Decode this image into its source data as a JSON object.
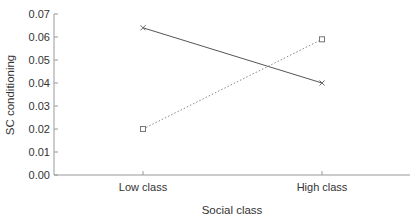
{
  "chart_data": {
    "type": "line",
    "title": "",
    "xlabel": "Social class",
    "ylabel": "SC conditioning",
    "categories": [
      "Low class",
      "High class"
    ],
    "series": [
      {
        "name": "series-cross-solid",
        "marker": "x",
        "line_style": "solid",
        "color": "#555555",
        "values": [
          0.064,
          0.04
        ]
      },
      {
        "name": "series-square-dotted",
        "marker": "square",
        "line_style": "dotted",
        "color": "#888888",
        "values": [
          0.02,
          0.059
        ]
      }
    ],
    "ylim": [
      0,
      0.07
    ],
    "yticks": [
      "0.00",
      "0.01",
      "0.02",
      "0.03",
      "0.04",
      "0.05",
      "0.06",
      "0.07"
    ],
    "grid": false,
    "legend": "none"
  }
}
